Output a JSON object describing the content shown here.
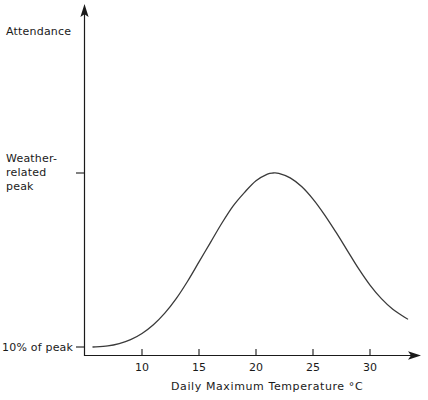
{
  "chart_data": {
    "type": "line",
    "title": "",
    "xlabel": "Daily Maximum Temperature °C",
    "ylabel": "Attendance",
    "xlim": [
      5.5,
      34.5
    ],
    "ylim": [
      0,
      100
    ],
    "grid": false,
    "legend": null,
    "x_ticks": [
      10,
      15,
      20,
      25,
      30
    ],
    "x_tick_labels": [
      "10",
      "15",
      "20",
      "25",
      "30"
    ],
    "y_ticks": [
      10,
      100
    ],
    "y_tick_labels": [
      "10% of peak",
      "Weather-related peak"
    ],
    "series": [
      {
        "name": "Attendance vs daily maximum temperature",
        "x": [
          5.7,
          7,
          8,
          9,
          10,
          11,
          12,
          13,
          14,
          15,
          16,
          17,
          18,
          19,
          20,
          21,
          21.5,
          22,
          23,
          24,
          25,
          26,
          27,
          28,
          29,
          30,
          31,
          32,
          33,
          33.3
        ],
        "y": [
          10,
          10.6,
          11.8,
          13.8,
          17,
          21.5,
          27.5,
          35,
          44,
          54,
          64,
          74,
          83,
          90,
          96,
          99.4,
          100,
          99.8,
          97.5,
          93,
          86.5,
          78.5,
          69.5,
          60,
          50.5,
          42,
          35,
          29.5,
          25.5,
          24.5
        ]
      }
    ]
  },
  "labels": {
    "y_axis_title": "Attendance",
    "y_tick_peak": "Weather-related peak",
    "y_tick_base": "10% of peak",
    "x_axis_title": "Daily Maximum Temperature °C",
    "x_tick_10": "10",
    "x_tick_15": "15",
    "x_tick_20": "20",
    "x_tick_25": "25",
    "x_tick_30": "30"
  },
  "style": {
    "background": "#ffffff",
    "ink": "#1a1a1a",
    "curve_color": "#3a3a3a"
  }
}
